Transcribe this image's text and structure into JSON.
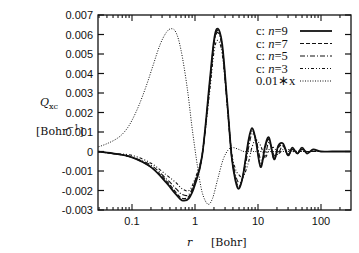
{
  "chart_data": {
    "type": "line",
    "title": "",
    "xlabel": "r",
    "xlabel_unit": "[Bohr]",
    "ylabel": "Q_xc",
    "ylabel_unit": "[Bohr^-1]",
    "xscale": "log",
    "xlim": [
      0.027,
      290
    ],
    "ylim": [
      -0.003,
      0.007
    ],
    "x_ticks": [
      0.1,
      1,
      10,
      100
    ],
    "x_tick_labels": [
      "0.1",
      "1",
      "10",
      "100"
    ],
    "y_ticks": [
      -0.003,
      -0.002,
      -0.001,
      0,
      0.001,
      0.002,
      0.003,
      0.004,
      0.005,
      0.006,
      0.007
    ],
    "y_tick_labels": [
      "-0.003",
      "-0.002",
      "-0.001",
      "0",
      "0.001",
      "0.002",
      "0.003",
      "0.004",
      "0.005",
      "0.006",
      "0.007"
    ],
    "grid": false,
    "legend_position": "upper right",
    "series": [
      {
        "name": "c: n=9",
        "style": "solid",
        "x": [
          0.027,
          0.05,
          0.1,
          0.2,
          0.35,
          0.5,
          0.62,
          0.8,
          1.0,
          1.3,
          1.7,
          2.0,
          2.3,
          2.7,
          3.2,
          3.8,
          4.4,
          5.0,
          5.8,
          7.0,
          8.0,
          9.2,
          11,
          13,
          15,
          18,
          21,
          25,
          30,
          35,
          42,
          50,
          60,
          75,
          100,
          150,
          290
        ],
        "y": [
          0.0,
          -0.0001,
          -0.0003,
          -0.0008,
          -0.0016,
          -0.0022,
          -0.0025,
          -0.0024,
          -0.0017,
          -0.0002,
          0.0035,
          0.0057,
          0.0063,
          0.0055,
          0.0028,
          -0.0002,
          -0.0015,
          -0.0019,
          -0.0012,
          0.0005,
          0.0012,
          0.0006,
          -0.0008,
          0.0003,
          0.0007,
          -0.0004,
          0.0003,
          0.0004,
          -0.0002,
          0.0002,
          -0.0001,
          0.0002,
          -0.0001,
          0.0001,
          0.0,
          0.0,
          0.0
        ]
      },
      {
        "name": "c: n=7",
        "style": "dashed",
        "x": [
          0.027,
          0.05,
          0.1,
          0.2,
          0.35,
          0.5,
          0.62,
          0.8,
          1.0,
          1.3,
          1.7,
          2.0,
          2.3,
          2.7,
          3.2,
          3.8,
          4.4,
          5.0,
          5.8,
          7.0,
          8.0,
          9.2,
          11,
          13,
          15,
          18,
          21,
          25,
          30,
          35,
          42,
          50,
          60,
          75,
          100,
          150,
          290
        ],
        "y": [
          0.0,
          -0.0001,
          -0.0003,
          -0.0008,
          -0.0015,
          -0.0021,
          -0.0024,
          -0.0023,
          -0.0016,
          -0.0002,
          0.0034,
          0.0056,
          0.0062,
          0.0054,
          0.0027,
          -0.0002,
          -0.0014,
          -0.0018,
          -0.0012,
          0.0004,
          0.0011,
          0.0006,
          -0.0007,
          0.0002,
          0.0006,
          -0.0004,
          0.0002,
          0.0003,
          -0.0002,
          0.0001,
          -0.0001,
          0.0001,
          0.0,
          0.0,
          0.0,
          0.0,
          0.0
        ]
      },
      {
        "name": "c: n=5",
        "style": "dash-dot",
        "x": [
          0.027,
          0.05,
          0.1,
          0.2,
          0.35,
          0.5,
          0.62,
          0.8,
          1.0,
          1.3,
          1.7,
          2.0,
          2.3,
          2.7,
          3.2,
          3.8,
          4.4,
          5.0,
          5.8,
          7.0,
          8.0,
          9.2,
          11,
          13,
          15,
          18,
          21,
          25,
          30,
          35,
          42,
          50,
          60,
          75,
          100,
          150,
          290
        ],
        "y": [
          0.0,
          -0.0001,
          -0.0003,
          -0.0007,
          -0.0014,
          -0.0019,
          -0.0022,
          -0.0022,
          -0.0015,
          -0.0002,
          0.0033,
          0.0055,
          0.0061,
          0.0053,
          0.0027,
          -0.0001,
          -0.0012,
          -0.0016,
          -0.0013,
          0.0001,
          0.0009,
          0.0007,
          -0.0004,
          -0.0002,
          0.0005,
          -0.0002,
          -0.0001,
          0.0003,
          -0.0001,
          0.0001,
          0.0,
          0.0001,
          0.0,
          0.0,
          0.0,
          0.0,
          0.0
        ]
      },
      {
        "name": "c: n=3",
        "style": "dash-dot-dot",
        "x": [
          0.027,
          0.05,
          0.1,
          0.2,
          0.35,
          0.5,
          0.62,
          0.8,
          1.0,
          1.3,
          1.7,
          2.0,
          2.3,
          2.7,
          3.2,
          3.8,
          4.4,
          5.0,
          5.8,
          7.0,
          8.0,
          9.2,
          11,
          13,
          15,
          18,
          21,
          25,
          30,
          35,
          42,
          50,
          60,
          75,
          100,
          150,
          290
        ],
        "y": [
          0.0,
          -0.0001,
          -0.0002,
          -0.0006,
          -0.0012,
          -0.0016,
          -0.0019,
          -0.002,
          -0.0014,
          -0.0001,
          0.003,
          0.0051,
          0.0057,
          0.005,
          0.0026,
          0.0,
          -0.0009,
          -0.0012,
          -0.0013,
          -0.0006,
          0.0002,
          0.0006,
          0.0003,
          -0.0003,
          0.0001,
          0.0002,
          -0.0001,
          0.0001,
          0.0001,
          0.0,
          0.0,
          0.0,
          0.0,
          0.0,
          0.0,
          0.0,
          0.0
        ]
      },
      {
        "name": "0.01*x",
        "style": "dotted",
        "x": [
          0.027,
          0.04,
          0.06,
          0.08,
          0.1,
          0.13,
          0.17,
          0.22,
          0.28,
          0.35,
          0.42,
          0.5,
          0.6,
          0.75,
          0.9,
          1.1,
          1.3,
          1.6,
          1.9,
          2.3,
          2.8,
          3.4,
          4.0,
          5.0,
          6.0,
          8.0,
          10,
          20,
          50,
          100,
          290
        ],
        "y": [
          0.0002,
          0.0004,
          0.0007,
          0.0011,
          0.0016,
          0.0024,
          0.0034,
          0.0045,
          0.0055,
          0.0061,
          0.0063,
          0.0061,
          0.0052,
          0.0033,
          0.0012,
          -0.0008,
          -0.0021,
          -0.0027,
          -0.0024,
          -0.0014,
          -0.0004,
          0.0001,
          0.0002,
          0.0001,
          0.0,
          0.0,
          0.0,
          0.0,
          0.0,
          0.0,
          0.0
        ]
      }
    ]
  },
  "axes": {
    "y_label_main": "Q",
    "y_label_sub": "xc",
    "y_unit_prefix": "[Bohr",
    "y_unit_sup": "−1",
    "y_unit_suffix": "]",
    "x_label": "r",
    "x_unit": "[Bohr]"
  },
  "legend": {
    "items": [
      {
        "prefix": "c: ",
        "var": "n",
        "eq": "=9"
      },
      {
        "prefix": "c: ",
        "var": "n",
        "eq": "=7"
      },
      {
        "prefix": "c: ",
        "var": "n",
        "eq": "=5"
      },
      {
        "prefix": "c: ",
        "var": "n",
        "eq": "=3"
      },
      {
        "prefix": "0.01∗x",
        "var": "",
        "eq": ""
      }
    ]
  }
}
